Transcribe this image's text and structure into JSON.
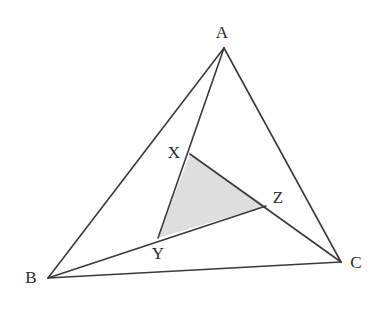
{
  "figure": {
    "kind": "geometry-diagram",
    "width": 387,
    "height": 314,
    "background_color": "#ffffff",
    "stroke_color": "#3a3a3a",
    "stroke_width": 1.6,
    "shaded_fill_color": "#dcdcdc",
    "shaded_fill_opacity": 0.95
  },
  "points": {
    "A": {
      "label": "A",
      "x": 224,
      "y": 48,
      "label_x": 222,
      "label_y": 32
    },
    "B": {
      "label": "B",
      "x": 48,
      "y": 278,
      "label_x": 31,
      "label_y": 277
    },
    "C": {
      "label": "C",
      "x": 341,
      "y": 262,
      "label_x": 356,
      "label_y": 262
    },
    "X": {
      "label": "X",
      "x": 190,
      "y": 154,
      "label_x": 174,
      "label_y": 152
    },
    "Y": {
      "label": "Y",
      "x": 158,
      "y": 238,
      "label_x": 158,
      "label_y": 253
    },
    "Z": {
      "label": "Z",
      "x": 266,
      "y": 206,
      "label_x": 278,
      "label_y": 197
    }
  },
  "segments": [
    {
      "name": "side-AB",
      "from": "A",
      "to": "B",
      "path": "224,48 48,278"
    },
    {
      "name": "side-AC",
      "from": "A",
      "to": "C",
      "path": "224,48 341,262"
    },
    {
      "name": "side-BC",
      "from": "B",
      "to": "C",
      "path": "48,278 341,262"
    },
    {
      "name": "cevian-A-to-Y",
      "from": "A",
      "to": "Y",
      "path": "224,48 158,238",
      "passes_through": "X"
    },
    {
      "name": "cevian-B-to-Z",
      "from": "B",
      "to": "Z",
      "path": "48,278 266,206",
      "passes_through": "Y"
    },
    {
      "name": "cevian-X-to-C",
      "from": "X",
      "to": "C",
      "path": "190,154 341,262",
      "passes_through": "Z"
    }
  ],
  "shaded_region": {
    "name": "triangle-XYZ",
    "vertices": [
      "X",
      "Y",
      "Z"
    ],
    "polygon": "190,154 158,238 266,206"
  },
  "labels": {
    "A": "A",
    "B": "B",
    "C": "C",
    "X": "X",
    "Y": "Y",
    "Z": "Z"
  }
}
